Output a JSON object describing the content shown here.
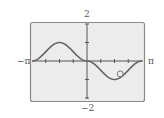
{
  "chart_data": {
    "type": "line",
    "title": "",
    "xlabel": "",
    "ylabel": "",
    "xlim": [
      "-π",
      "π"
    ],
    "ylim": [
      -2,
      2
    ],
    "x_tick_labels": {
      "left": "−π",
      "right": "π"
    },
    "y_tick_labels": {
      "top": "2",
      "bottom": "−2"
    },
    "x_ticks": [
      "-3π/4",
      "-π/2",
      "-π/4",
      "π/4",
      "π/2",
      "3π/4"
    ],
    "y_ticks": [
      -2,
      -1,
      0,
      1,
      2
    ],
    "grid": false,
    "series": [
      {
        "name": "f(x)",
        "x": [
          -3.14,
          -2.36,
          -1.57,
          -0.79,
          0,
          0.79,
          1.57,
          2.36,
          3.14
        ],
        "y": [
          0,
          0.5,
          1.0,
          0.5,
          0,
          -0.5,
          -1.0,
          -0.5,
          0
        ]
      }
    ],
    "annotations": [
      {
        "type": "circle-marker",
        "x": 1.9,
        "y": -0.7
      }
    ]
  },
  "labels": {
    "y_max": "2",
    "y_min": "−2",
    "x_min": "−π",
    "x_max": "π"
  },
  "colors": {
    "frame": "#8a8a8a",
    "plot_bg": "#ececec",
    "axis": "#555555",
    "curve": "#666666"
  }
}
